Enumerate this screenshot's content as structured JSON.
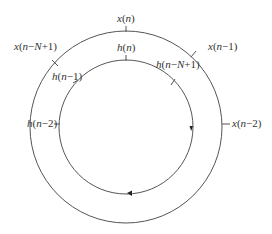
{
  "diagram": {
    "outer_ring": {
      "labels": [
        {
          "id": "x_n",
          "text": "x(n)"
        },
        {
          "id": "x_n_1",
          "text": "x(n−1)"
        },
        {
          "id": "x_n_2",
          "text": "x(n−2)"
        },
        {
          "id": "x_n_N_1",
          "text": "x(n−N+1)"
        }
      ]
    },
    "inner_ring": {
      "labels": [
        {
          "id": "h_n",
          "text": "h(n)"
        },
        {
          "id": "h_n_1",
          "text": "h(n−1)"
        },
        {
          "id": "h_n_2",
          "text": "h(n−2)"
        },
        {
          "id": "h_n_N_1",
          "text": "h(n−N+1)"
        }
      ],
      "direction": "clockwise"
    },
    "colors": {
      "stroke": "#555555",
      "text": "#333333",
      "background": "#ffffff"
    }
  }
}
